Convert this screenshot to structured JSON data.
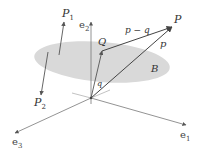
{
  "diagram": {
    "colors": {
      "background": "#ffffff",
      "plane_fill": "#d9d9d9",
      "line": "#666666",
      "text": "#333333"
    },
    "origin": {
      "x": 91,
      "y": 98
    },
    "axes": [
      {
        "id": "e1",
        "label": "e",
        "subscript": "1",
        "tip": {
          "x": 186,
          "y": 125
        }
      },
      {
        "id": "e2",
        "label": "e",
        "subscript": "2",
        "tip": {
          "x": 91,
          "y": 22
        }
      },
      {
        "id": "e3",
        "label": "e",
        "subscript": "3",
        "tip": {
          "x": 15,
          "y": 133
        }
      }
    ],
    "plane": {
      "label": "B",
      "cx": 102,
      "cy": 62,
      "rx": 68,
      "ry": 20,
      "rotation": 5
    },
    "points": {
      "P": {
        "label": "P",
        "x": 172,
        "y": 26
      },
      "Q": {
        "label": "Q",
        "x": 102,
        "y": 51
      },
      "P1": {
        "label": "P",
        "subscript": "1",
        "x": 64,
        "y": 22
      },
      "P2": {
        "label": "P",
        "subscript": "2",
        "x": 41,
        "y": 95
      }
    },
    "vectors": {
      "p": {
        "label": "p"
      },
      "q": {
        "label": "q"
      },
      "p_minus_q": {
        "label": "p − q"
      }
    }
  }
}
